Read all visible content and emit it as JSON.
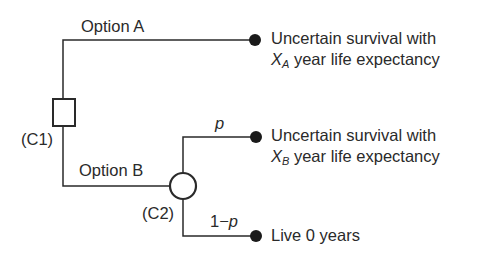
{
  "diagram": {
    "type": "decision-tree",
    "nodes": {
      "chance_node_1": {
        "label": "(C1)",
        "shape": "square"
      },
      "chance_node_2": {
        "label": "(C2)",
        "shape": "circle"
      }
    },
    "branches": {
      "option_a": {
        "label": "Option A"
      },
      "option_b": {
        "label": "Option B"
      },
      "p": {
        "label": "p"
      },
      "one_minus_p": {
        "label": "1−p"
      }
    },
    "outcomes": {
      "a": {
        "line1": "Uncertain survival with",
        "var": "X",
        "sub": "A",
        "line2": " year life expectancy"
      },
      "b": {
        "line1": "Uncertain survival with",
        "var": "X",
        "sub": "B",
        "line2": " year life expectancy"
      },
      "c": {
        "line1": "Live 0 years"
      }
    },
    "colors": {
      "line": "#2a2a2a",
      "background": "#ffffff"
    }
  }
}
